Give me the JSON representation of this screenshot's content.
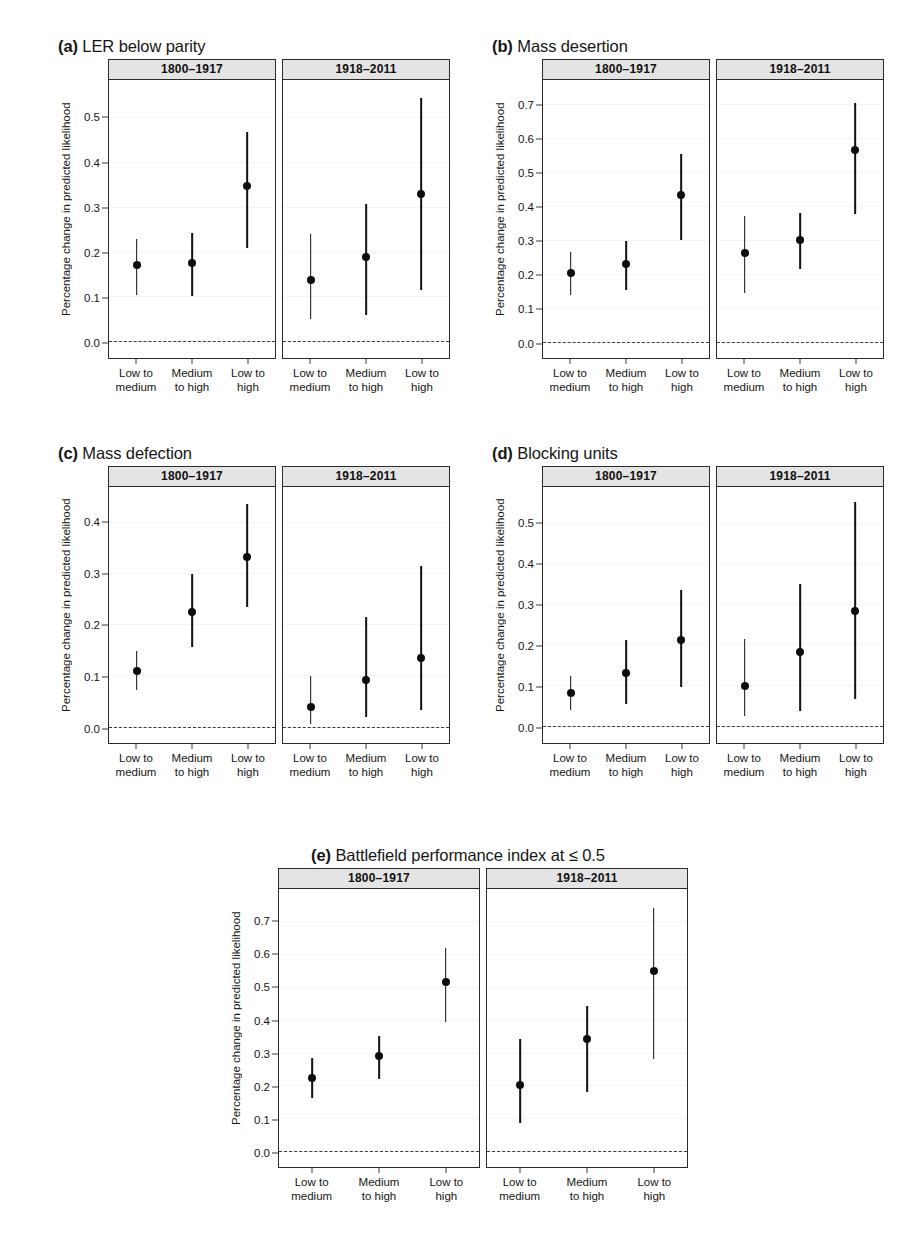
{
  "figure": {
    "y_axis_title": "Percentage change in predicted likelihood",
    "facet_labels": [
      "1800–1917",
      "1918–2011"
    ],
    "x_categories": [
      {
        "line1": "Low to",
        "line2": "medium"
      },
      {
        "line1": "Medium",
        "line2": "to high"
      },
      {
        "line1": "Low to",
        "line2": "high"
      }
    ],
    "caption": "",
    "colors": {
      "point": "#0d0d0d",
      "errorbar": "#121212",
      "strip_background": "#e4e4e4",
      "panel_border": "#2b2b2b",
      "zero_line": "#3c3c3c",
      "background": "#ffffff"
    }
  },
  "chart_data": [
    {
      "type": "scatter",
      "panel": "a",
      "tag": "(a)",
      "title": "LER below parity",
      "xlabel": "",
      "ylabel": "Percentage change in predicted likelihood",
      "ylim": [
        -0.035,
        0.585
      ],
      "yticks": [
        0.0,
        0.1,
        0.2,
        0.3,
        0.4,
        0.5
      ],
      "ytick_labels": [
        "0.0",
        "0.1",
        "0.2",
        "0.3",
        "0.4",
        "0.5"
      ],
      "grid": false,
      "zero_reference": 0.0,
      "categories": [
        "Low to medium",
        "Medium to high",
        "Low to high"
      ],
      "facets": [
        {
          "label": "1800–1917",
          "values": [
            0.173,
            0.176,
            0.348
          ],
          "lower": [
            0.105,
            0.104,
            0.21
          ],
          "upper": [
            0.231,
            0.244,
            0.47
          ]
        },
        {
          "label": "1918–2011",
          "values": [
            0.14,
            0.19,
            0.33
          ],
          "lower": [
            0.052,
            0.061,
            0.117
          ],
          "upper": [
            0.241,
            0.308,
            0.545
          ]
        }
      ]
    },
    {
      "type": "scatter",
      "panel": "b",
      "tag": "(b)",
      "title": "Mass desertion",
      "xlabel": "",
      "ylabel": "Percentage change in predicted likelihood",
      "ylim": [
        -0.045,
        0.775
      ],
      "yticks": [
        0.0,
        0.1,
        0.2,
        0.3,
        0.4,
        0.5,
        0.6,
        0.7
      ],
      "ytick_labels": [
        "0.0",
        "0.1",
        "0.2",
        "0.3",
        "0.4",
        "0.5",
        "0.6",
        "0.7"
      ],
      "grid": false,
      "zero_reference": 0.0,
      "categories": [
        "Low to medium",
        "Medium to high",
        "Low to high"
      ],
      "facets": [
        {
          "label": "1800–1917",
          "values": [
            0.207,
            0.232,
            0.437
          ],
          "lower": [
            0.142,
            0.156,
            0.304
          ],
          "upper": [
            0.267,
            0.3,
            0.557
          ]
        },
        {
          "label": "1918–2011",
          "values": [
            0.265,
            0.302,
            0.568
          ],
          "lower": [
            0.148,
            0.217,
            0.381
          ],
          "upper": [
            0.374,
            0.382,
            0.708
          ]
        }
      ]
    },
    {
      "type": "scatter",
      "panel": "c",
      "tag": "(c)",
      "title": "Mass defection",
      "xlabel": "",
      "ylabel": "Percentage change in predicted likelihood",
      "ylim": [
        -0.03,
        0.47
      ],
      "yticks": [
        0.0,
        0.1,
        0.2,
        0.3,
        0.4
      ],
      "ytick_labels": [
        "0.0",
        "0.1",
        "0.2",
        "0.3",
        "0.4"
      ],
      "grid": false,
      "zero_reference": 0.0,
      "categories": [
        "Low to medium",
        "Medium to high",
        "Low to high"
      ],
      "facets": [
        {
          "label": "1800–1917",
          "values": [
            0.11,
            0.225,
            0.334
          ],
          "lower": [
            0.073,
            0.158,
            0.236
          ],
          "upper": [
            0.149,
            0.301,
            0.437
          ]
        },
        {
          "label": "1918–2011",
          "values": [
            0.041,
            0.093,
            0.136
          ],
          "lower": [
            0.007,
            0.02,
            0.034
          ],
          "upper": [
            0.1,
            0.216,
            0.315
          ]
        }
      ]
    },
    {
      "type": "scatter",
      "panel": "d",
      "tag": "(d)",
      "title": "Blocking units",
      "xlabel": "",
      "ylabel": "Percentage change in predicted likelihood",
      "ylim": [
        -0.04,
        0.59
      ],
      "yticks": [
        0.0,
        0.1,
        0.2,
        0.3,
        0.4,
        0.5
      ],
      "ytick_labels": [
        "0.0",
        "0.1",
        "0.2",
        "0.3",
        "0.4",
        "0.5"
      ],
      "grid": false,
      "zero_reference": 0.0,
      "categories": [
        "Low to medium",
        "Medium to high",
        "Low to high"
      ],
      "facets": [
        {
          "label": "1800–1917",
          "values": [
            0.082,
            0.132,
            0.213
          ],
          "lower": [
            0.042,
            0.056,
            0.099
          ],
          "upper": [
            0.124,
            0.214,
            0.336
          ]
        },
        {
          "label": "1918–2011",
          "values": [
            0.1,
            0.183,
            0.284
          ],
          "lower": [
            0.026,
            0.039,
            0.068
          ],
          "upper": [
            0.215,
            0.351,
            0.552
          ]
        }
      ]
    },
    {
      "type": "scatter",
      "panel": "e",
      "tag": "(e)",
      "title": "Battlefield performance index at ≤ 0.5",
      "xlabel": "",
      "ylabel": "Percentage change in predicted likelihood",
      "ylim": [
        -0.045,
        0.8
      ],
      "yticks": [
        0.0,
        0.1,
        0.2,
        0.3,
        0.4,
        0.5,
        0.6,
        0.7
      ],
      "ytick_labels": [
        "0.0",
        "0.1",
        "0.2",
        "0.3",
        "0.4",
        "0.5",
        "0.6",
        "0.7"
      ],
      "grid": false,
      "zero_reference": 0.0,
      "categories": [
        "Low to medium",
        "Medium to high",
        "Low to high"
      ],
      "facets": [
        {
          "label": "1800–1917",
          "values": [
            0.226,
            0.292,
            0.518
          ],
          "lower": [
            0.165,
            0.223,
            0.395
          ],
          "upper": [
            0.285,
            0.353,
            0.62
          ]
        },
        {
          "label": "1918–2011",
          "values": [
            0.205,
            0.343,
            0.551
          ],
          "lower": [
            0.09,
            0.183,
            0.284
          ],
          "upper": [
            0.345,
            0.445,
            0.742
          ]
        }
      ]
    }
  ]
}
